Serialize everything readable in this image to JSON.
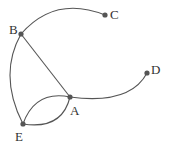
{
  "diagram": {
    "type": "graph",
    "colors": {
      "edge": "#555555",
      "node": "#555555",
      "label": "#333333"
    },
    "nodes": [
      {
        "id": "A",
        "label": "A",
        "x": 70,
        "y": 97
      },
      {
        "id": "B",
        "label": "B",
        "x": 21,
        "y": 34
      },
      {
        "id": "C",
        "label": "C",
        "x": 105,
        "y": 15
      },
      {
        "id": "D",
        "label": "D",
        "x": 147,
        "y": 73
      },
      {
        "id": "E",
        "label": "E",
        "x": 23,
        "y": 124
      }
    ],
    "edges": [
      {
        "from": "B",
        "to": "C",
        "shape": "curve"
      },
      {
        "from": "B",
        "to": "A",
        "shape": "straight"
      },
      {
        "from": "B",
        "to": "E",
        "shape": "curve"
      },
      {
        "from": "A",
        "to": "D",
        "shape": "curve"
      },
      {
        "from": "A",
        "to": "E",
        "shape": "curve-upper"
      },
      {
        "from": "A",
        "to": "E",
        "shape": "curve-lower"
      }
    ]
  }
}
